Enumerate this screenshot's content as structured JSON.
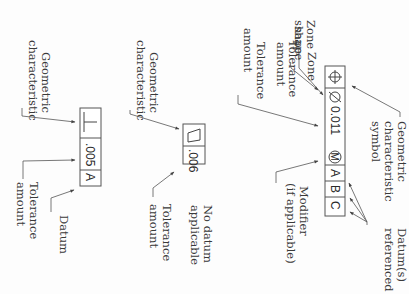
{
  "figure": {
    "orientation": "rotated 90 degrees clockwise",
    "examples": [
      {
        "id": "full",
        "frame_cells": [
          "⊕",
          "Ø 0.011",
          "Ⓜ",
          "A",
          "B",
          "C"
        ],
        "labels": {
          "zone_shape": [
            "Zone",
            "shape"
          ],
          "tolerance_amount": [
            "Tolerance",
            "amount"
          ],
          "geometric_symbol": [
            "Geometric",
            "characteristic",
            "symbol"
          ],
          "modifier": [
            "Modifier",
            "(if applicable)"
          ],
          "datums": [
            "Datum(s)",
            "referenced"
          ]
        }
      },
      {
        "id": "flatness",
        "frame_cells": [
          "▱",
          ".006"
        ],
        "labels": {
          "geometric": [
            "Geometric",
            "characteristic"
          ],
          "tolerance_amount": [
            "Tolerance",
            "amount"
          ],
          "no_datum": [
            "No datum",
            "applicable"
          ]
        }
      },
      {
        "id": "perpendicularity",
        "frame_cells": [
          "⊥",
          ".005",
          "A"
        ],
        "labels": {
          "geometric": [
            "Geometric",
            "characteristic"
          ],
          "tolerance_amount": [
            "Tolerance",
            "amount"
          ],
          "datum": [
            "Datum"
          ]
        }
      }
    ]
  },
  "text": {
    "f1_sym": "⊕",
    "f1_dia": "Ø",
    "f1_tol": "0.011",
    "f1_mod": "M",
    "f1_a": "A",
    "f1_b": "B",
    "f1_c": "C",
    "zone1": "Zone",
    "zone2": "shape",
    "tol1a": "Tolerance",
    "tol1b": "amount",
    "geo1a": "Geometric",
    "geo1b": "characteristic",
    "geo1c": "symbol",
    "mod1": "Modifier",
    "mod2": "(if applicable)",
    "dat1": "Datum(s)",
    "dat2": "referenced",
    "f2_tol": ".006",
    "geo2a": "Geometric",
    "geo2b": "characteristic",
    "tol2a": "Tolerance",
    "tol2b": "amount",
    "nod1": "No datum",
    "nod2": "applicable",
    "f3_tol": ".005",
    "f3_a": "A",
    "geo3a": "Geometric",
    "geo3b": "characteristic",
    "tol3a": "Tolerance",
    "tol3b": "amount",
    "datum3": "Datum"
  }
}
